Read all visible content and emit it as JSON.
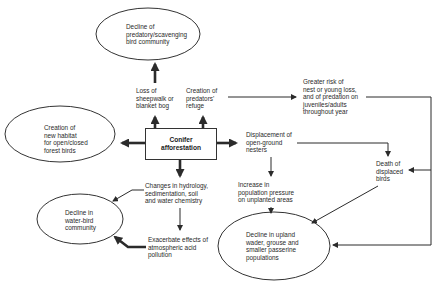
{
  "diagram": {
    "type": "flow-diagram",
    "central": {
      "id": "conifer",
      "label": "Conifer\nafforestation"
    },
    "ellipses": [
      {
        "id": "predatory",
        "label": "Decline of\npredatory/scavenging\nbird community"
      },
      {
        "id": "habitat",
        "label": "Creation of\nnew habitat\nfor open/closed\nforest birds"
      },
      {
        "id": "waterbird",
        "label": "Decline in\nwater-bird\ncommunity"
      },
      {
        "id": "upland",
        "label": "Decline in upland\nwader, grouse and\nsmaller passerine\npopulations"
      }
    ],
    "texts": [
      {
        "id": "sheepwalk",
        "label": "Loss of\nsheepwalk or\nblanket bog"
      },
      {
        "id": "refuge",
        "label": "Creation of\npredators'\nrefuge"
      },
      {
        "id": "greater_risk",
        "label": "Greater risk of\nnest or young loss,\nand of predation on\njuveniles/adults\nthroughout year"
      },
      {
        "id": "displacement",
        "label": "Displacement of\nopen-ground\nnesters"
      },
      {
        "id": "death",
        "label": "Death of\ndisplaced\nbirds"
      },
      {
        "id": "pressure",
        "label": "Increase in\npopulation pressure\non unplanted areas"
      },
      {
        "id": "hydrology",
        "label": "Changes in hydrology,\nsedimentation, soil\nand water chemistry"
      },
      {
        "id": "acid",
        "label": "Exacerbate effects of\natmospheric acid\npollution"
      }
    ],
    "edges": [
      {
        "from": "conifer",
        "to": "sheepwalk"
      },
      {
        "from": "conifer",
        "to": "refuge"
      },
      {
        "from": "sheepwalk",
        "to": "predatory"
      },
      {
        "from": "refuge",
        "to": "greater_risk"
      },
      {
        "from": "conifer",
        "to": "habitat"
      },
      {
        "from": "conifer",
        "to": "displacement"
      },
      {
        "from": "conifer",
        "to": "hydrology"
      },
      {
        "from": "displacement",
        "to": "death"
      },
      {
        "from": "displacement",
        "to": "pressure"
      },
      {
        "from": "greater_risk",
        "to": "death"
      },
      {
        "from": "greater_risk",
        "to": "upland"
      },
      {
        "from": "death",
        "to": "upland"
      },
      {
        "from": "pressure",
        "to": "upland"
      },
      {
        "from": "hydrology",
        "to": "waterbird"
      },
      {
        "from": "hydrology",
        "to": "acid"
      },
      {
        "from": "acid",
        "to": "waterbird"
      }
    ],
    "colors": {
      "line": "#2b2b2b",
      "background": "#ffffff",
      "text": "#2a2a2a"
    }
  }
}
